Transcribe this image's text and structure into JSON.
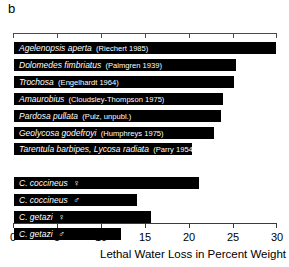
{
  "panel": {
    "letter": "b"
  },
  "axis": {
    "title": "Lethal Water Loss in Percent Weight",
    "min": 0,
    "max": 30,
    "tick_values": [
      0,
      5,
      10,
      15,
      20,
      25,
      30
    ],
    "tick_labels": [
      "0",
      "5",
      "10",
      "15",
      "20",
      "25",
      "30"
    ],
    "top_axis_visible": true,
    "bottom_axis_visible": true
  },
  "chart_data": {
    "type": "bar",
    "orientation": "horizontal",
    "title": "",
    "subtitle": "",
    "xlabel": "Lethal Water Loss in Percent Weight",
    "ylabel": "",
    "xlim": [
      0,
      30
    ],
    "grid": false,
    "legend": "none",
    "bar_color": "#000000",
    "label_color": "#ffffff",
    "categories": [
      "Agelenopsis aperta (Riechert 1985)",
      "Dolomedes fimbriatus (Palmgren 1939)",
      "Trochosa (Engelhardt 1964)",
      "Amaurobius (Cloudsley-Thompson 1975)",
      "Pardosa pullata (Pulz, unpubl.)",
      "Geolycosa godefroyi (Humphreys 1975)",
      "Tarentula barbipes, Lycosa radiata (Parry 1954)",
      "C. coccineus ♀",
      "C. coccineus ♂",
      "C. getazi ♀",
      "C. getazi ♂"
    ],
    "values": [
      30.0,
      25.5,
      25.2,
      24.0,
      23.7,
      23.0,
      20.5,
      21.2,
      14.2,
      15.8,
      12.4
    ]
  },
  "bars": [
    {
      "name": "Agelenopsis aperta",
      "citation": "(Riechert 1985)",
      "sex": "",
      "value": 30.0,
      "group": "literature"
    },
    {
      "name": "Dolomedes fimbriatus",
      "citation": "(Palmgren 1939)",
      "sex": "",
      "value": 25.5,
      "group": "literature"
    },
    {
      "name": "Trochosa",
      "citation": "(Engelhardt 1964)",
      "sex": "",
      "value": 25.2,
      "group": "literature"
    },
    {
      "name": "Amaurobius",
      "citation": "(Cloudsley-Thompson 1975)",
      "sex": "",
      "value": 24.0,
      "group": "literature"
    },
    {
      "name": "Pardosa pullata",
      "citation": "(Pulz, unpubl.)",
      "sex": "",
      "value": 23.7,
      "group": "literature"
    },
    {
      "name": "Geolycosa godefroyi",
      "citation": "(Humphreys 1975)",
      "sex": "",
      "value": 23.0,
      "group": "literature"
    },
    {
      "name": "Tarentula barbipes, Lycosa radiata",
      "citation": "(Parry 1954)",
      "sex": "",
      "value": 20.5,
      "group": "literature"
    },
    {
      "name": "C. coccineus",
      "citation": "",
      "sex": "♀",
      "value": 21.2,
      "group": "study"
    },
    {
      "name": "C. coccineus",
      "citation": "",
      "sex": "♂",
      "value": 14.2,
      "group": "study"
    },
    {
      "name": "C. getazi",
      "citation": "",
      "sex": "♀",
      "value": 15.8,
      "group": "study"
    },
    {
      "name": "C. getazi",
      "citation": "",
      "sex": "♂",
      "value": 12.4,
      "group": "study"
    }
  ]
}
